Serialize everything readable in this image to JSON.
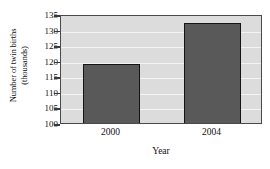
{
  "chart_data": {
    "type": "bar",
    "title": "",
    "subtitle": "",
    "categories": [
      "2000",
      "2004"
    ],
    "values": [
      118.9,
      132.2
    ],
    "series": [
      {
        "name": "Number of twin births (thousands)",
        "values": [
          118.9,
          132.2
        ]
      }
    ],
    "xlabel": "Year",
    "ylabel_line1": "Number of twin births",
    "ylabel_line2": "(thousands)",
    "ylabel": "Number of twin births (thousands)",
    "ylim": [
      100,
      135
    ],
    "yticks": [
      100,
      105,
      110,
      115,
      120,
      125,
      130,
      135
    ],
    "ytick_labels": [
      "100",
      "105",
      "110",
      "115",
      "120",
      "125",
      "130",
      "135"
    ],
    "grid": true,
    "grid_orientation": "horizontal",
    "legend": false,
    "legend_position": "none",
    "annotations": [],
    "colors": {
      "bar_fill": "#595959",
      "bar_edge": "#141414",
      "plot_background": "#dcdcdc",
      "gridline": "#f4f4f4",
      "axis": "#4a4a4a",
      "figure_background": "#ffffff",
      "text": "#111111"
    }
  }
}
